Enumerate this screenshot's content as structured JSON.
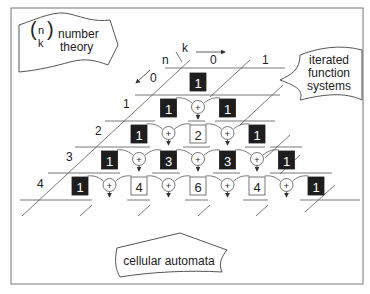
{
  "callouts": {
    "number_theory": {
      "symbol_top": "n",
      "symbol_bottom": "k",
      "line1": "number",
      "line2": "theory"
    },
    "iterated_function_systems": {
      "line1": "iterated",
      "line2": "function",
      "line3": "systems"
    },
    "cellular_automata": {
      "text": "cellular automata"
    }
  },
  "axes": {
    "n_label": "n",
    "k_label": "k"
  },
  "row_labels": [
    "0",
    "1",
    "2",
    "3",
    "4"
  ],
  "col_labels": [
    "0",
    "1"
  ],
  "operator_symbol": "+",
  "colors": {
    "filled_cell": "#1e1e1e",
    "filled_text": "#ffffff",
    "line": "#555555",
    "frame": "#777777"
  },
  "rows": [
    {
      "n": 0,
      "cells": [
        {
          "value": "1",
          "filled": true
        }
      ]
    },
    {
      "n": 1,
      "cells": [
        {
          "value": "1",
          "filled": true
        },
        {
          "value": "1",
          "filled": true
        }
      ]
    },
    {
      "n": 2,
      "cells": [
        {
          "value": "1",
          "filled": true
        },
        {
          "value": "2",
          "filled": false
        },
        {
          "value": "1",
          "filled": true
        }
      ]
    },
    {
      "n": 3,
      "cells": [
        {
          "value": "1",
          "filled": true
        },
        {
          "value": "3",
          "filled": true
        },
        {
          "value": "3",
          "filled": true
        },
        {
          "value": "1",
          "filled": true
        }
      ]
    },
    {
      "n": 4,
      "cells": [
        {
          "value": "1",
          "filled": true
        },
        {
          "value": "4",
          "filled": false
        },
        {
          "value": "6",
          "filled": false
        },
        {
          "value": "4",
          "filled": false
        },
        {
          "value": "1",
          "filled": true
        }
      ]
    }
  ]
}
